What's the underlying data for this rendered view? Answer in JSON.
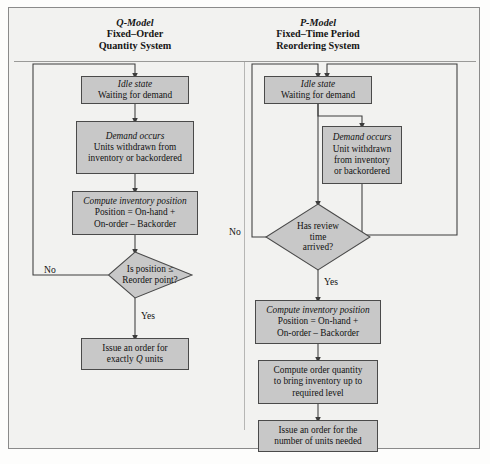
{
  "figure": {
    "type": "flowchart",
    "background_color": "#f2f2f0",
    "box_fill_color": "#c8c8c8",
    "box_border_color": "#4a4a4a",
    "line_color": "#3c3c3c"
  },
  "panels": [
    {
      "id": "q-model",
      "title": {
        "model": "Q-Model",
        "line2": "Fixed–Order",
        "line3": "Quantity System"
      },
      "nodes": [
        {
          "id": "q-idle",
          "shape": "process",
          "emphasis": "Idle state",
          "lines": [
            "Waiting for demand"
          ]
        },
        {
          "id": "q-demand",
          "shape": "process",
          "emphasis": "Demand occurs",
          "lines": [
            "Units withdrawn from",
            "inventory or backordered"
          ]
        },
        {
          "id": "q-compute",
          "shape": "process",
          "emphasis": "Compute inventory position",
          "lines": [
            "Position = On-hand +",
            "On-order – Backorder"
          ]
        },
        {
          "id": "q-decision",
          "shape": "decision",
          "lines": [
            "Is position ≤",
            "Reorder point?"
          ]
        },
        {
          "id": "q-issue",
          "shape": "process",
          "lines": [
            "Issue an order for",
            "exactly Q units"
          ],
          "italic_token": "Q"
        }
      ],
      "edge_labels": [
        {
          "id": "q-no",
          "text": "No"
        },
        {
          "id": "q-yes",
          "text": "Yes"
        }
      ]
    },
    {
      "id": "p-model",
      "title": {
        "model": "P-Model",
        "line2": "Fixed–Time Period",
        "line3": "Reordering System"
      },
      "nodes": [
        {
          "id": "p-idle",
          "shape": "process",
          "emphasis": "Idle state",
          "lines": [
            "Waiting for demand"
          ]
        },
        {
          "id": "p-demand",
          "shape": "process",
          "emphasis": "Demand occurs",
          "lines": [
            "Unit withdrawn",
            "from inventory",
            "or backordered"
          ]
        },
        {
          "id": "p-decision",
          "shape": "decision",
          "lines": [
            "Has review",
            "time",
            "arrived?"
          ]
        },
        {
          "id": "p-compute",
          "shape": "process",
          "emphasis": "Compute inventory position",
          "lines": [
            "Position = On-hand +",
            "On-order – Backorder"
          ]
        },
        {
          "id": "p-quantity",
          "shape": "process",
          "lines": [
            "Compute order quantity",
            "to bring inventory up to",
            "required level"
          ]
        },
        {
          "id": "p-issue",
          "shape": "process",
          "lines": [
            "Issue an order for the",
            "number of units needed"
          ]
        }
      ],
      "edge_labels": [
        {
          "id": "p-no",
          "text": "No"
        },
        {
          "id": "p-yes",
          "text": "Yes"
        }
      ]
    }
  ]
}
